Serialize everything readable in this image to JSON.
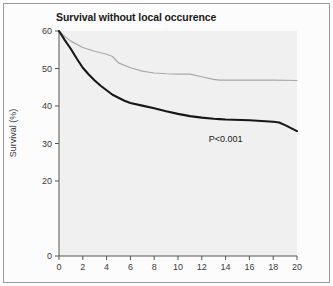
{
  "figure": {
    "background_color": "#fcfcfc",
    "frame_color": "#9a9a9a",
    "plot_background_color": "#f0f0f0"
  },
  "chart_data": {
    "type": "line",
    "title": "Survival without local occurence",
    "subtitle": "",
    "xlabel": "",
    "ylabel": "Survival (%)",
    "xlim": [
      0,
      20
    ],
    "ylim": [
      0,
      60
    ],
    "xticks": [
      0,
      2,
      4,
      6,
      8,
      10,
      12,
      14,
      16,
      18,
      20
    ],
    "xtick_labels": [
      "0",
      "2",
      "4",
      "6",
      "8",
      "10",
      "12",
      "14",
      "16",
      "18",
      "20"
    ],
    "yticks": [
      0,
      20,
      30,
      40,
      50,
      60
    ],
    "ytick_labels": [
      "0",
      "20",
      "30",
      "40",
      "50",
      "60"
    ],
    "grid": false,
    "legend": null,
    "annotations": [
      {
        "text": "P<0.001",
        "x": 14.0,
        "y": 30.5
      }
    ],
    "series": [
      {
        "name": "upper-curve",
        "color": "#a8a8a8",
        "line_width": 1.2,
        "x": [
          0,
          0.5,
          1,
          2,
          3,
          4,
          4.5,
          5,
          6,
          7,
          8,
          9,
          10,
          11,
          12,
          13,
          13.5,
          14,
          16,
          18,
          20
        ],
        "values": [
          60,
          58.5,
          57.3,
          55.6,
          54.6,
          53.8,
          53.2,
          51.5,
          50.2,
          49.3,
          48.8,
          48.6,
          48.5,
          48.5,
          47.8,
          47.1,
          46.9,
          46.9,
          46.9,
          46.9,
          46.8
        ]
      },
      {
        "name": "lower-curve",
        "color": "#171717",
        "line_width": 2.1,
        "x": [
          0,
          0.5,
          1,
          1.5,
          2,
          2.5,
          3,
          3.5,
          4,
          4.5,
          5,
          5.5,
          6,
          7,
          8,
          9,
          10,
          11,
          12,
          13,
          13.5,
          14,
          16,
          18,
          18.5,
          19,
          20
        ],
        "values": [
          60,
          57.5,
          55.2,
          52.6,
          50.2,
          48.4,
          46.8,
          45.4,
          44.2,
          43.0,
          42.2,
          41.4,
          40.8,
          40.1,
          39.4,
          38.6,
          37.9,
          37.3,
          36.9,
          36.6,
          36.5,
          36.4,
          36.2,
          35.8,
          35.6,
          34.9,
          33.3
        ]
      }
    ]
  }
}
